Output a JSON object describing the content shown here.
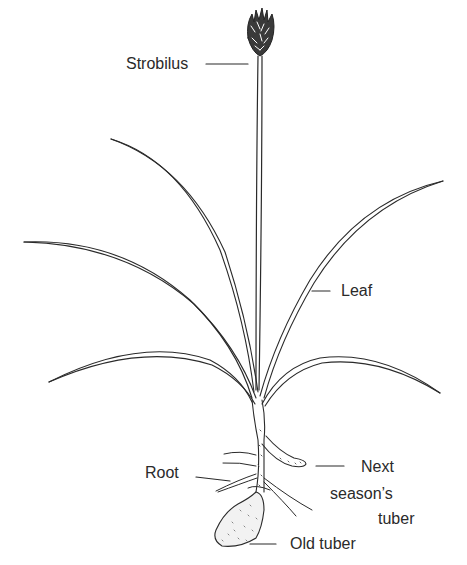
{
  "diagram": {
    "labels": {
      "strobilus": "Strobilus",
      "leaf": "Leaf",
      "root": "Root",
      "next_tuber_line1": "Next",
      "next_tuber_line2": "season’s",
      "next_tuber_line3": "tuber",
      "old_tuber": "Old tuber"
    },
    "colors": {
      "ink": "#2a2a2a",
      "background": "#ffffff"
    }
  }
}
